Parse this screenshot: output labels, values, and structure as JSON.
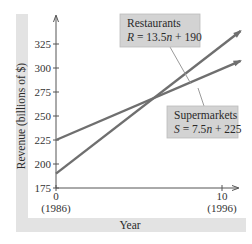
{
  "chart_data": {
    "type": "line",
    "title": "",
    "xlabel": "Year",
    "ylabel": "Revenue (billions of $)",
    "xlim": [
      0,
      11
    ],
    "ylim": [
      175,
      345
    ],
    "x_ticks": [
      {
        "value": 0,
        "label": "0",
        "sublabel": "(1986)"
      },
      {
        "value": 10,
        "label": "10",
        "sublabel": "(1996)"
      }
    ],
    "y_ticks": [
      {
        "value": 175,
        "label": "175"
      },
      {
        "value": 200,
        "label": "200"
      },
      {
        "value": 225,
        "label": "225"
      },
      {
        "value": 250,
        "label": "250"
      },
      {
        "value": 275,
        "label": "275"
      },
      {
        "value": 300,
        "label": "300"
      },
      {
        "value": 325,
        "label": "325"
      }
    ],
    "grid": false,
    "series": [
      {
        "name": "Restaurants",
        "equation": "R = 13.5n + 190",
        "slope": 13.5,
        "intercept": 190,
        "x": [
          0,
          11
        ],
        "values": [
          190,
          338.5
        ]
      },
      {
        "name": "Supermarkets",
        "equation": "S = 7.5n + 225",
        "slope": 7.5,
        "intercept": 225,
        "x": [
          0,
          11
        ],
        "values": [
          225,
          307.5
        ]
      }
    ],
    "annotations": [
      {
        "series": "Restaurants",
        "title": "Restaurants",
        "eq_var": "R",
        "eq_rest": " = 13.5",
        "eq_n": "n",
        "eq_tail": " + 190",
        "points_to_x": 8.2
      },
      {
        "series": "Supermarkets",
        "title": "Supermarkets",
        "eq_var": "S",
        "eq_rest": " = 7.5",
        "eq_n": "n",
        "eq_tail": " + 225",
        "points_to_x": 8.6
      }
    ]
  },
  "colors": {
    "line": "#6f6f6f",
    "axis": "#555555",
    "band": "#e3e3e3",
    "callout_bg": "#d3d3d3",
    "callout_border": "#bcbcbc"
  }
}
